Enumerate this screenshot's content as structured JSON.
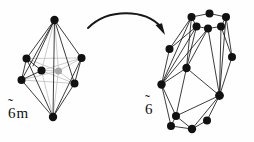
{
  "figure": {
    "background_color": "#fefefe",
    "ink_color": "#111111",
    "hidden_edge_color": "#c2c2c2",
    "center_vertex_color": "#a8a8a8",
    "arrow": {
      "name": "transformation-arrow",
      "direction": "left-to-right",
      "style": "curved-with-arrowhead"
    },
    "left_diagram": {
      "label": "6̃m",
      "label_base": "6",
      "label_tilde": "̃",
      "label_suffix": "m",
      "description": "hexagonal bipyramid with central vertex",
      "vertex_count": 9,
      "vertices": [
        {
          "id": "apex-top",
          "x": 54.5,
          "y": 20.0,
          "kind": "solid"
        },
        {
          "id": "ring-left",
          "x": 26.5,
          "y": 58.5,
          "kind": "solid"
        },
        {
          "id": "ring-right",
          "x": 81.5,
          "y": 58.0,
          "kind": "solid"
        },
        {
          "id": "ring-front-l",
          "x": 41.5,
          "y": 70.5,
          "kind": "solid"
        },
        {
          "id": "ring-back-lo",
          "x": 21.5,
          "y": 80.0,
          "kind": "solid"
        },
        {
          "id": "ring-front-r",
          "x": 74.5,
          "y": 83.5,
          "kind": "solid"
        },
        {
          "id": "apex-bottom",
          "x": 53.0,
          "y": 117.0,
          "kind": "solid"
        },
        {
          "id": "center",
          "x": 58.5,
          "y": 71.0,
          "kind": "center"
        }
      ]
    },
    "right_diagram": {
      "label": "6̃",
      "label_base": "6",
      "label_tilde": "̃",
      "label_suffix": "",
      "description": "distorted polyhedron, hexagonal antiprism-like cage",
      "vertex_count": 14
    }
  }
}
